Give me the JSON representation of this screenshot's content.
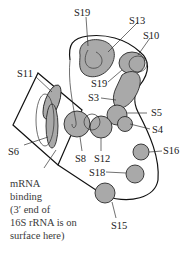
{
  "diagram": {
    "proteins": [
      {
        "id": "S19",
        "label": "S19"
      },
      {
        "id": "S13",
        "label": "S13"
      },
      {
        "id": "S10",
        "label": "S10"
      },
      {
        "id": "S11",
        "label": "S11"
      },
      {
        "id": "S19b",
        "label": "S19"
      },
      {
        "id": "S3",
        "label": "S3"
      },
      {
        "id": "S5",
        "label": "S5"
      },
      {
        "id": "S4",
        "label": "S4"
      },
      {
        "id": "S6",
        "label": "S6"
      },
      {
        "id": "S8",
        "label": "S8"
      },
      {
        "id": "S12",
        "label": "S12"
      },
      {
        "id": "S16",
        "label": "S16"
      },
      {
        "id": "S18",
        "label": "S18"
      },
      {
        "id": "S15",
        "label": "S15"
      }
    ],
    "caption_lines": [
      "mRNA",
      "binding",
      "(3′ end of",
      "16S rRNA is on",
      "surface here)"
    ],
    "colors": {
      "protein_fill": "#a9a9a9",
      "outline": "#111111",
      "text": "#1a1a1a"
    }
  }
}
